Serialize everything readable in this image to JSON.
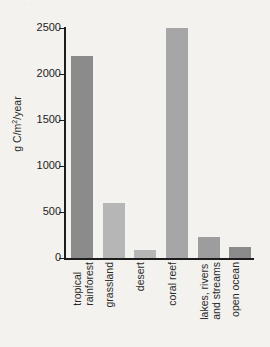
{
  "figure": {
    "clipped_caption": "·   ·    ·              ·",
    "background_color": "#f3f2ee"
  },
  "chart_data": {
    "type": "bar",
    "title": "",
    "xlabel": "",
    "ylabel": "g C/m²/year",
    "ylabel_parts": {
      "pre": "g C/m",
      "sup": "2",
      "post": "/year"
    },
    "categories": [
      "tropical\nrainforest",
      "grassland",
      "desert",
      "coral reef",
      "lakes, rivers\nand streams",
      "open ocean"
    ],
    "values": [
      2200,
      600,
      90,
      2500,
      230,
      120
    ],
    "ylim": [
      0,
      2500
    ],
    "yticks": [
      0,
      500,
      1000,
      1500,
      2000,
      2500
    ],
    "ytick_labels": [
      "0",
      "500",
      "1000",
      "1500",
      "2000",
      "2500"
    ],
    "grid": false,
    "legend": "none",
    "bar_colors": [
      "#8b8b8b",
      "#b6b6b6",
      "#b6b6b6",
      "#a6a6a6",
      "#9d9d9d",
      "#8b8b8b"
    ],
    "axis_color": "#1d1d1d"
  }
}
